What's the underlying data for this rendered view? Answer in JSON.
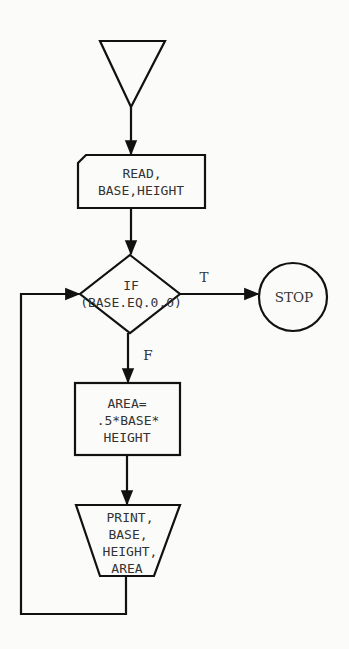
{
  "diagram": {
    "type": "flowchart",
    "nodes": {
      "start": {
        "shape": "inverted-triangle",
        "label": ""
      },
      "read": {
        "shape": "card-input",
        "lines": [
          "READ,",
          "BASE,HEIGHT"
        ]
      },
      "decision": {
        "shape": "diamond",
        "lines": [
          "IF",
          "(BASE.EQ.0.0)"
        ]
      },
      "stop": {
        "shape": "circle",
        "label": "STOP"
      },
      "compute": {
        "shape": "rectangle",
        "lines": [
          "AREA=",
          ".5*BASE*",
          "HEIGHT"
        ]
      },
      "print": {
        "shape": "trapezoid-output",
        "lines": [
          "PRINT,",
          "BASE,",
          "HEIGHT,",
          "AREA"
        ]
      }
    },
    "edges": {
      "true_label": "T",
      "false_label": "F"
    },
    "colors": {
      "stroke": "#111111",
      "text": "#333333",
      "background": "#fbfbfa"
    }
  }
}
